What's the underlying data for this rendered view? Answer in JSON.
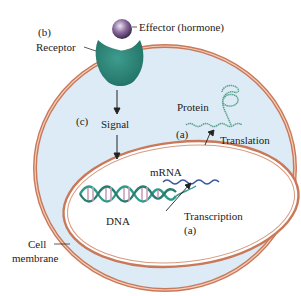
{
  "diagram": {
    "labels": {
      "effector": "Effector (hormone)",
      "b": "(b)",
      "receptor": "Receptor",
      "c": "(c)",
      "signal": "Signal",
      "protein": "Protein",
      "a_translation": "(a)",
      "translation": "Translation",
      "mrna": "mRNA",
      "dna": "DNA",
      "transcription": "Transcription",
      "a_transcription": "(a)",
      "cell": "Cell",
      "membrane": "membrane"
    },
    "colors": {
      "cytoplasm": "#dcebf5",
      "membrane": "#c9785a",
      "receptor": "#2f8a7c",
      "effector": "#6b4d7c",
      "dna": "#2e9a8a",
      "mrna": "#3c5a9c",
      "protein": "#5aa08c"
    }
  }
}
